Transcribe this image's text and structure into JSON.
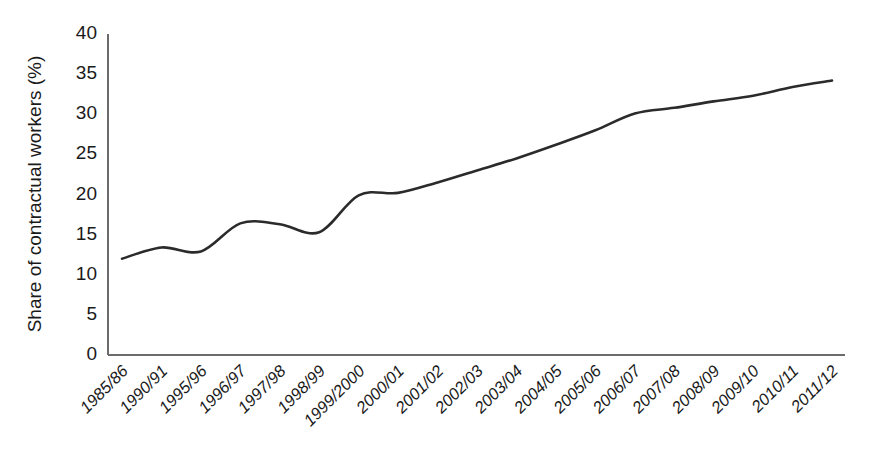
{
  "chart_data": {
    "type": "line",
    "title": "",
    "xlabel": "",
    "ylabel": "Share of contractual workers (%)",
    "categories": [
      "1985/86",
      "1990/91",
      "1995/96",
      "1996/97",
      "1997/98",
      "1998/99",
      "1999/2000",
      "2000/01",
      "2001/02",
      "2002/03",
      "2003/04",
      "2004/05",
      "2005/06",
      "2006/07",
      "2007/08",
      "2008/09",
      "2009/10",
      "2010/11",
      "2011/12"
    ],
    "values": [
      12.0,
      13.4,
      12.9,
      16.4,
      16.3,
      15.3,
      19.9,
      20.2,
      21.5,
      23.0,
      24.5,
      26.2,
      28.0,
      30.1,
      30.8,
      31.6,
      32.3,
      33.4,
      34.2
    ],
    "ylim": [
      0,
      40
    ],
    "yticks": [
      0,
      5,
      10,
      15,
      20,
      25,
      30,
      35,
      40
    ],
    "ytick_labels": [
      "0",
      "5",
      "10",
      "15",
      "20",
      "25",
      "30",
      "35",
      "40"
    ],
    "grid": false,
    "legend": "none",
    "series_color": "#2b2b2b",
    "axis_color": "#6b6b6b",
    "background_color": "#ffffff",
    "line_width": 2.6,
    "xtick_rotation_deg": -45,
    "smoothing": "spline"
  }
}
